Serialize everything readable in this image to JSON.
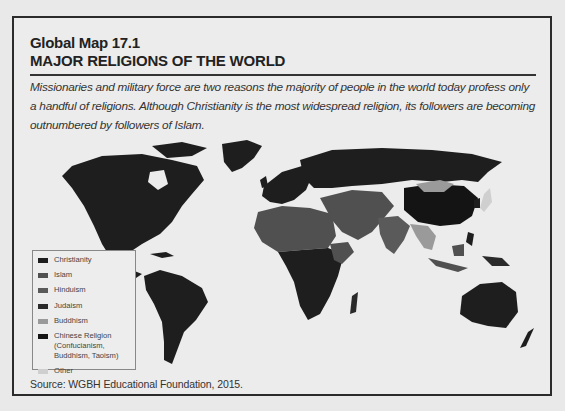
{
  "header": {
    "figure_label": "Global Map 17.1",
    "title": "MAJOR RELIGIONS OF THE WORLD"
  },
  "caption": "Missionaries and military force are two reasons the majority of people in the world today profess only a handful of religions. Although Christianity is the most widespread religion, its followers are becoming outnumbered by followers of Islam.",
  "legend": {
    "items": [
      {
        "label": "Christianity",
        "color": "#1e1e1e"
      },
      {
        "label": "Islam",
        "color": "#505050"
      },
      {
        "label": "Hinduism",
        "color": "#5a5a5a"
      },
      {
        "label": "Judaism",
        "color": "#2a2a2a"
      },
      {
        "label": "Buddhism",
        "color": "#9a9a9a"
      },
      {
        "label": "Chinese Religion (Confucianism, Buddhism, Taoism)",
        "color": "#141414"
      },
      {
        "label": "Other",
        "color": "#cfcfcf"
      }
    ]
  },
  "source": "Source:  WGBH Educational Foundation, 2015.",
  "map": {
    "background": "#ececec",
    "regions": {
      "north_america": "Christianity",
      "south_america": "Christianity",
      "europe": "Christianity",
      "russia": "Christianity",
      "north_africa": "Islam",
      "middle_east": "Islam",
      "central_asia": "Islam",
      "sub_saharan_africa": "Christianity",
      "india": "Hinduism",
      "china": "Chinese Religion",
      "mongolia": "Buddhism",
      "southeast_asia": "Buddhism",
      "indonesia": "Islam",
      "australia": "Christianity",
      "japan": "Other"
    }
  }
}
